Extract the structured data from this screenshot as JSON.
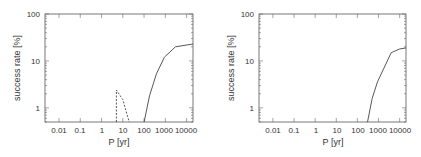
{
  "chart_data": [
    {
      "type": "line",
      "title": "",
      "xlabel": "P [yr]",
      "ylabel": "success rate [%]",
      "xscale": "log",
      "yscale": "log",
      "xlim": [
        0.0022,
        20000
      ],
      "ylim": [
        0.5,
        100
      ],
      "xticks": [
        "0.01",
        "0.1",
        "1",
        "10",
        "100",
        "1000",
        "10000"
      ],
      "yticks": [
        "1",
        "10",
        "100"
      ],
      "grid": false,
      "legend": null,
      "series": [
        {
          "name": "solid",
          "style": "solid",
          "x": [
            100,
            180,
            380,
            900,
            3000,
            20000
          ],
          "y": [
            0.5,
            1.8,
            5.3,
            12,
            20,
            23
          ]
        },
        {
          "name": "dashed",
          "style": "dashed",
          "x": [
            5,
            5,
            10,
            20
          ],
          "y": [
            0.5,
            2.4,
            1.5,
            0.5
          ]
        }
      ]
    },
    {
      "type": "line",
      "title": "",
      "xlabel": "P [yr]",
      "ylabel": "success rate [%]",
      "xscale": "log",
      "yscale": "log",
      "xlim": [
        0.0022,
        20000
      ],
      "ylim": [
        0.5,
        100
      ],
      "xticks": [
        "0.01",
        "0.1",
        "1",
        "10",
        "100",
        "1000",
        "10000"
      ],
      "yticks": [
        "1",
        "10",
        "100"
      ],
      "grid": false,
      "legend": null,
      "series": [
        {
          "name": "solid",
          "style": "solid",
          "x": [
            300,
            500,
            900,
            4000,
            10000,
            20000
          ],
          "y": [
            0.5,
            1.6,
            3.6,
            15,
            18,
            19
          ]
        }
      ]
    }
  ],
  "panels": [
    {
      "ylabel": "success rate [%]",
      "xlabel": "P [yr]",
      "xticks": [
        "0.01",
        "0.1",
        "1",
        "10",
        "100",
        "1000",
        "10000"
      ],
      "yticks": [
        "1",
        "10",
        "100"
      ]
    },
    {
      "ylabel": "success rate [%]",
      "xlabel": "P [yr]",
      "xticks": [
        "0.01",
        "0.1",
        "1",
        "10",
        "100",
        "1000",
        "10000"
      ],
      "yticks": [
        "1",
        "10",
        "100"
      ]
    }
  ]
}
